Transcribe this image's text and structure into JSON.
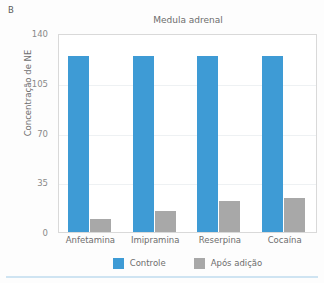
{
  "panel": {
    "letter": "B"
  },
  "legend": {
    "position": "bottom-center",
    "items": [
      {
        "label": "Controle",
        "color": "#3E9BD5",
        "swatch_name": "legend-swatch-controle"
      },
      {
        "label": "Após adição",
        "color": "#A8A8A8",
        "swatch_name": "legend-swatch-apos-adicao"
      }
    ]
  },
  "chart_data": {
    "type": "bar",
    "title": "Medula adrenal",
    "xlabel": "",
    "ylabel": "Concentração de NE",
    "ylim": [
      0,
      140
    ],
    "yticks": [
      0,
      35,
      70,
      105,
      140
    ],
    "ytick_labels": [
      "0",
      "35",
      "70",
      "105",
      "140"
    ],
    "grid": true,
    "grid_axis": "y",
    "legend_position": "bottom-center",
    "categories": [
      "Anfetamina",
      "Imipramina",
      "Reserpina",
      "Cocaína"
    ],
    "series": [
      {
        "name": "Controle",
        "color": "#3E9BD5",
        "values": [
          124,
          124,
          124,
          124
        ]
      },
      {
        "name": "Após adição",
        "color": "#A8A8A8",
        "values": [
          9,
          15,
          22,
          24
        ]
      }
    ]
  },
  "colors": {
    "control_blue": "#3E9BD5",
    "after_gray": "#A8A8A8",
    "axis_text": "#6D6D6D",
    "tick_text": "#8A8A8A",
    "gridline": "#EEF1F3",
    "plot_border": "#D9D9D9",
    "bottom_rule": "#CFE4F2"
  }
}
